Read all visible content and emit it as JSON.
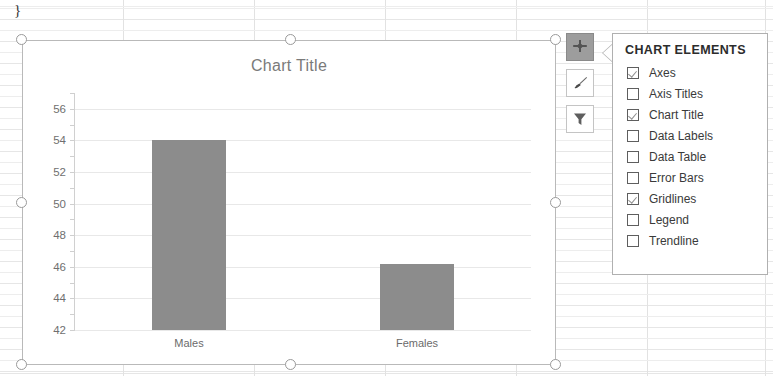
{
  "sheet": {
    "cell_remnant": "}"
  },
  "chart": {
    "title": "Chart Title",
    "selected": true
  },
  "toolbar": {
    "buttons": [
      {
        "name": "chart-elements-button",
        "icon": "plus-icon",
        "label": "Chart Elements",
        "active": true
      },
      {
        "name": "chart-styles-button",
        "icon": "paintbrush-icon",
        "label": "Chart Styles",
        "active": false
      },
      {
        "name": "chart-filters-button",
        "icon": "funnel-icon",
        "label": "Chart Filters",
        "active": false
      }
    ]
  },
  "chart_elements_panel": {
    "header": "CHART ELEMENTS",
    "items": [
      {
        "label": "Axes",
        "checked": true
      },
      {
        "label": "Axis Titles",
        "checked": false
      },
      {
        "label": "Chart Title",
        "checked": true
      },
      {
        "label": "Data Labels",
        "checked": false
      },
      {
        "label": "Data Table",
        "checked": false
      },
      {
        "label": "Error Bars",
        "checked": false
      },
      {
        "label": "Gridlines",
        "checked": true
      },
      {
        "label": "Legend",
        "checked": false
      },
      {
        "label": "Trendline",
        "checked": false
      }
    ]
  },
  "chart_data": {
    "type": "bar",
    "title": "Chart Title",
    "xlabel": "",
    "ylabel": "",
    "categories": [
      "Males",
      "Females"
    ],
    "values": [
      54,
      46.2
    ],
    "ylim": [
      42,
      57
    ],
    "yticks": [
      42,
      44,
      46,
      48,
      50,
      52,
      54,
      56
    ],
    "grid": true,
    "legend": false,
    "bar_color": "#8c8c8c"
  }
}
